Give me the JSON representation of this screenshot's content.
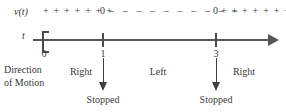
{
  "figure": {
    "velocity_label": "v(t)",
    "time_axis_label": "t",
    "sign_row": {
      "plus_left": "+ + + + + + +",
      "zero_left": "0",
      "minus_middle": "– – – – – – – – – –",
      "zero_right": "0",
      "plus_right": "+ + + + + + +"
    },
    "ticks": [
      {
        "value": "0",
        "endpoint": "closed-bracket"
      },
      {
        "value": "1",
        "endpoint": "tick"
      },
      {
        "value": "3",
        "endpoint": "tick"
      }
    ],
    "direction_of_motion_label": "Direction\nof Motion",
    "direction_of_motion_line1": "Direction",
    "direction_of_motion_line2": "of Motion",
    "intervals": [
      {
        "label": "Right"
      },
      {
        "label": "Left"
      },
      {
        "label": "Right"
      }
    ],
    "stopped_markers": [
      {
        "label": "Stopped",
        "at": "1"
      },
      {
        "label": "Stopped",
        "at": "3"
      }
    ],
    "colors": {
      "ink": "#3a3a3a",
      "axis": "#555555",
      "background": "#ffffff"
    }
  },
  "chart_data": {
    "type": "line",
    "title": "",
    "xlabel": "t",
    "ylabel": "v(t)",
    "x": [
      0,
      1,
      3
    ],
    "sign_intervals": [
      {
        "from": "0",
        "to": "1",
        "sign": "+",
        "direction": "Right"
      },
      {
        "from": "1",
        "to": "3",
        "sign": "-",
        "direction": "Left"
      },
      {
        "from": "3",
        "to": "infinity",
        "sign": "+",
        "direction": "Right"
      }
    ],
    "zeros": [
      1,
      3
    ],
    "annotations": [
      "Stopped",
      "Stopped"
    ],
    "xlim": [
      0,
      5
    ],
    "grid": false
  }
}
